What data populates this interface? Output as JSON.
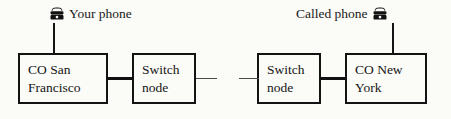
{
  "diagram": {
    "background_color": "#fbfbf7",
    "line_color": "#131313",
    "endpoints": [
      {
        "id": "your-phone",
        "label": "Your phone",
        "icon": "telephone-icon",
        "icon_position": "before"
      },
      {
        "id": "called-phone",
        "label": "Called phone",
        "icon": "telephone-icon",
        "icon_position": "after"
      }
    ],
    "nodes": [
      {
        "id": "co-san-francisco",
        "label": "CO San\nFrancisco"
      },
      {
        "id": "switch-node-1",
        "label": "Switch\nnode"
      },
      {
        "id": "switch-node-2",
        "label": "Switch\nnode"
      },
      {
        "id": "co-new-york",
        "label": "CO New\nYork"
      }
    ],
    "links": [
      {
        "id": "link-sf-switch",
        "style": "thick"
      },
      {
        "id": "link-break",
        "style": "thin-broken"
      },
      {
        "id": "link-switch-ny",
        "style": "thick"
      }
    ]
  }
}
